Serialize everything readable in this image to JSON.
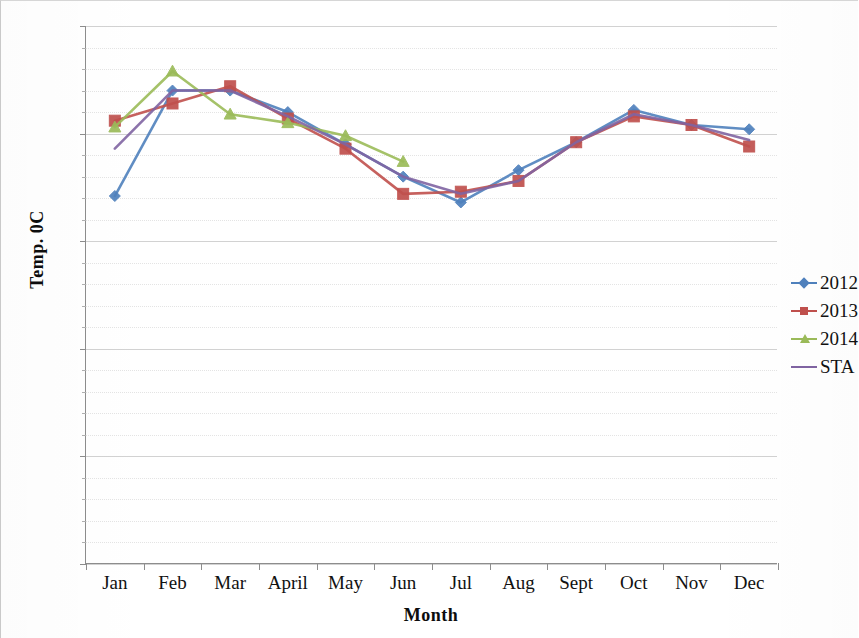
{
  "chart_data": {
    "type": "line",
    "title": "",
    "xlabel": "Month",
    "ylabel": "Temp. 0C",
    "categories": [
      "Jan",
      "Feb",
      "Mar",
      "April",
      "May",
      "Jun",
      "Jul",
      "Aug",
      "Sept",
      "Oct",
      "Nov",
      "Dec"
    ],
    "ylim": [
      0,
      25
    ],
    "yticks": [
      0,
      5,
      10,
      15,
      20,
      25
    ],
    "grid": true,
    "legend_position": "right",
    "series": [
      {
        "name": "2012",
        "color": "#4F81BD",
        "marker": "diamond",
        "values": [
          17.1,
          22.0,
          22.0,
          21.0,
          19.5,
          18.0,
          16.8,
          18.3,
          19.6,
          21.1,
          20.4,
          20.2
        ]
      },
      {
        "name": "2013",
        "color": "#C0504D",
        "marker": "square",
        "values": [
          20.6,
          21.4,
          22.2,
          20.7,
          19.3,
          17.2,
          17.3,
          17.8,
          19.6,
          20.8,
          20.4,
          19.4
        ]
      },
      {
        "name": "2014",
        "color": "#9BBB59",
        "marker": "triangle",
        "values": [
          20.3,
          22.9,
          20.9,
          20.5,
          19.9,
          18.7,
          null,
          null,
          null,
          null,
          null,
          null
        ]
      },
      {
        "name": "STA",
        "color": "#8064A2",
        "marker": "none",
        "values": [
          19.3,
          22.0,
          22.0,
          20.8,
          19.5,
          18.0,
          17.2,
          17.8,
          19.6,
          20.9,
          20.4,
          19.7
        ]
      }
    ]
  },
  "axes": {
    "y_title": "Temp. 0C",
    "x_title": "Month",
    "y_tick_labels": [
      "0",
      "5",
      "10",
      "15",
      "20",
      "25"
    ],
    "x_tick_labels": [
      "Jan",
      "Feb",
      "Mar",
      "April",
      "May",
      "Jun",
      "Jul",
      "Aug",
      "Sept",
      "Oct",
      "Nov",
      "Dec"
    ]
  },
  "legend": {
    "entries": [
      {
        "label": "2012",
        "color": "#4F81BD",
        "marker": "diamond"
      },
      {
        "label": "2013",
        "color": "#C0504D",
        "marker": "square"
      },
      {
        "label": "2014",
        "color": "#9BBB59",
        "marker": "triangle"
      },
      {
        "label": "STA",
        "color": "#8064A2",
        "marker": "none"
      }
    ]
  }
}
